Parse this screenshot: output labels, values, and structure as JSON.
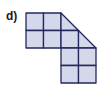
{
  "label": "d)",
  "figure": {
    "fill": "#d5d7ea",
    "stroke": "#23285e",
    "origin": [
      26,
      13
    ],
    "cell": 17.5,
    "cells": [
      {
        "row": 0,
        "col": 0,
        "shape": "square"
      },
      {
        "row": 0,
        "col": 1,
        "shape": "square"
      },
      {
        "row": 0,
        "col": 2,
        "shape": "triangle-lower-left"
      },
      {
        "row": 1,
        "col": 0,
        "shape": "square"
      },
      {
        "row": 1,
        "col": 1,
        "shape": "square"
      },
      {
        "row": 1,
        "col": 2,
        "shape": "square"
      },
      {
        "row": 1,
        "col": 3,
        "shape": "triangle-lower-left"
      },
      {
        "row": 2,
        "col": 2,
        "shape": "square"
      },
      {
        "row": 2,
        "col": 3,
        "shape": "square"
      },
      {
        "row": 3,
        "col": 2,
        "shape": "square"
      },
      {
        "row": 3,
        "col": 3,
        "shape": "square"
      }
    ]
  }
}
